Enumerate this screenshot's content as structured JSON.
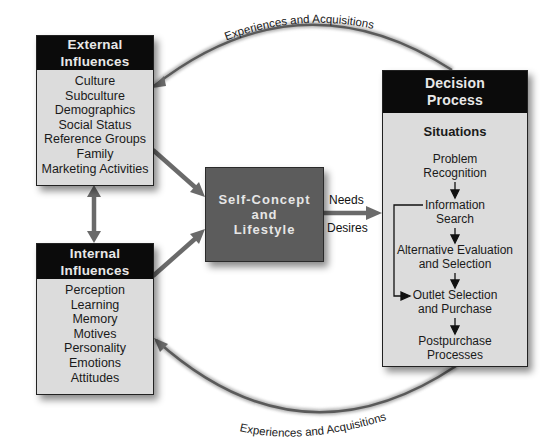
{
  "external_influences": {
    "title_line1": "External",
    "title_line2": "Influences",
    "items": [
      "Culture",
      "Subculture",
      "Demographics",
      "Social Status",
      "Reference Groups",
      "Family",
      "Marketing Activities"
    ]
  },
  "internal_influences": {
    "title_line1": "Internal",
    "title_line2": "Influences",
    "items": [
      "Perception",
      "Learning",
      "Memory",
      "Motives",
      "Personality",
      "Emotions",
      "Attitudes"
    ]
  },
  "self_concept": {
    "line1": "Self-Concept",
    "line2": "and",
    "line3": "Lifestyle"
  },
  "connector_labels": {
    "needs": "Needs",
    "desires": "Desires",
    "top_arc": "Experiences and Acquisitions",
    "bottom_arc": "Experiences and Acquisitions"
  },
  "decision_process": {
    "title_line1": "Decision",
    "title_line2": "Process",
    "situations": "Situations",
    "steps": [
      {
        "line1": "Problem",
        "line2": "Recognition"
      },
      {
        "line1": "Information",
        "line2": "Search"
      },
      {
        "line1": "Alternative Evaluation",
        "line2": "and Selection"
      },
      {
        "line1": "Outlet Selection",
        "line2": "and Purchase"
      },
      {
        "line1": "Postpurchase",
        "line2": "Processes"
      }
    ]
  },
  "colors": {
    "header_fill": "#0b0b0b",
    "box_fill": "#dcdcdc",
    "self_concept_fill": "#5c5c5c",
    "connector": "#555555"
  }
}
